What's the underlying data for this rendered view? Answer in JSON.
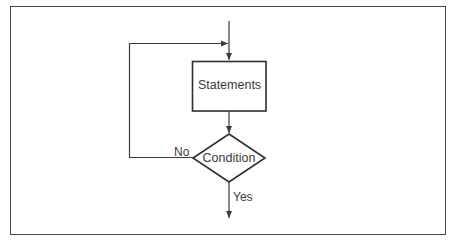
{
  "diagram": {
    "type": "flowchart",
    "colors": {
      "stroke": "#3a3a3a",
      "background": "#ffffff",
      "frame": "#4a4a4a"
    },
    "nodes": [
      {
        "id": "statements",
        "shape": "rectangle",
        "label": "Statements"
      },
      {
        "id": "condition",
        "shape": "diamond",
        "label": "Condition"
      }
    ],
    "edges": [
      {
        "from": "entry",
        "to": "statements",
        "label": ""
      },
      {
        "from": "statements",
        "to": "condition",
        "label": ""
      },
      {
        "from": "condition",
        "to": "statements",
        "label": "No"
      },
      {
        "from": "condition",
        "to": "exit",
        "label": "Yes"
      }
    ],
    "labels": {
      "statements": "Statements",
      "condition": "Condition",
      "no": "No",
      "yes": "Yes"
    }
  }
}
